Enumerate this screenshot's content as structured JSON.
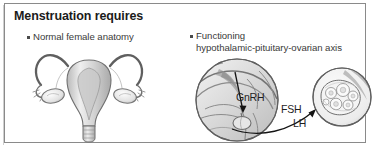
{
  "slide": {
    "title": "Menstruation requires",
    "bullets": [
      {
        "marker": "square-bullet",
        "lines": [
          "Normal female anatomy"
        ]
      },
      {
        "marker": "square-bullet",
        "lines": [
          "Functioning",
          "hypothalamic-pituitary-ovarian axis"
        ]
      }
    ],
    "figures": [
      {
        "name": "uterus-ovaries-illustration",
        "caption": ""
      },
      {
        "name": "hypothalamus-pituitary-brain-illustration",
        "caption": ""
      },
      {
        "name": "ovary-follicles-illustration",
        "caption": ""
      }
    ],
    "hormone_labels": {
      "gnrh": "GnRH",
      "fsh": "FSH",
      "lh": "LH"
    },
    "colors": {
      "title_text": "#1b1b1b",
      "body_text": "#3a3a3a",
      "label_text": "#1f1f1f",
      "frame_border": "#8a8a8a",
      "background": "#ffffff",
      "illustration_ink": "#6e6e6e"
    }
  }
}
